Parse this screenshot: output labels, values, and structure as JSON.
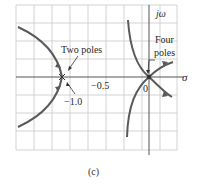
{
  "figure": {
    "caption": "(c)",
    "type": "root-locus",
    "axes": {
      "real_axis_label": "σ",
      "imag_axis_label": "jω",
      "tick_labels": [
        "−1.0",
        "−0.5",
        "0"
      ]
    },
    "annotations": {
      "two_poles": "Two poles",
      "four_poles_line1": "Four",
      "four_poles_line2": "poles"
    },
    "colors": {
      "grid": "#c8c8c8",
      "axis": "#555555",
      "locus": "#5a5a5a",
      "text": "#2a2a2a"
    },
    "poles": [
      {
        "location": -1.0,
        "multiplicity": 2
      },
      {
        "location": 0.0,
        "multiplicity": 4
      }
    ]
  }
}
